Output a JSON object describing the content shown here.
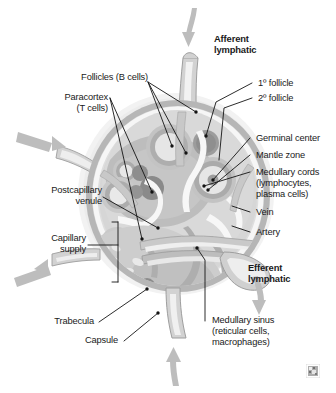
{
  "figure": {
    "type": "anatomical-illustration",
    "style": "grayscale textbook diagram",
    "background_color": "#ffffff",
    "palette": {
      "halo": "#efefef",
      "capsule_outer": "#b0b0b0",
      "cortex_light": "#e4e4e4",
      "cortex_mid": "#cfcfcf",
      "paracortex": "#b8b8b8",
      "medulla_dark": "#9a9a9a",
      "follicle_dark": "#8e8e8e",
      "sinus_white": "#f7f7f7",
      "vessel_gray": "#c4c4c4",
      "arrow_gray": "#bdbdbd",
      "leader_line": "#141414",
      "text": "#1a1a1a"
    }
  },
  "labels": {
    "afferent_lymphatic": "Afferent\nlymphatic",
    "efferent_lymphatic": "Efferent\nlymphatic",
    "follicles_b_cells": "Follicles (B cells)",
    "paracortex_t_cells": "Paracortex\n(T cells)",
    "primary_follicle": "1º follicle",
    "secondary_follicle": "2º follicle",
    "germinal_center": "Germinal center",
    "mantle_zone": "Mantle zone",
    "medullary_cords": "Medullary cords\n(lymphocytes,\nplasma cells)",
    "vein": "Vein",
    "artery": "Artery",
    "postcapillary_venule": "Postcapillary\nvenule",
    "capillary_supply": "Capillary\nsupply",
    "trabecula": "Trabecula",
    "capsule": "Capsule",
    "medullary_sinus": "Medullary sinus\n(reticular cells,\nmacrophages)"
  },
  "corner": {
    "icon": "thumbnail-watermark-icon"
  }
}
